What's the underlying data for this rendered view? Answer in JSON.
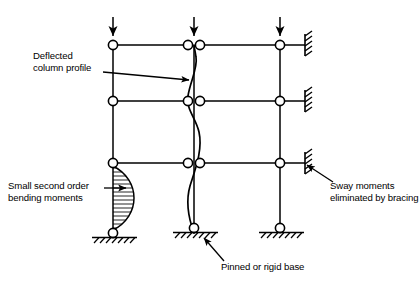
{
  "figure": {
    "type": "structural-engineering-diagram",
    "background_color": "#ffffff",
    "line_color": "#000000",
    "width": 419,
    "height": 285
  },
  "labels": {
    "deflected_profile": "Deflected\ncolumn profile",
    "small_moments": "Small second order\nbending moments",
    "sway": "Sway moments\neliminated by bracing",
    "base": "Pinned or rigid base"
  },
  "frame": {
    "columns": [
      {
        "name": "left-column",
        "x": 113,
        "top_y": 45,
        "base_y": 233
      },
      {
        "name": "middle-column",
        "x": 194,
        "top_y": 45,
        "base_y": 228
      },
      {
        "name": "right-column",
        "x": 280,
        "top_y": 45,
        "base_y": 228
      }
    ],
    "beam_levels": [
      {
        "name": "roof-beam-level",
        "y": 45
      },
      {
        "name": "second-floor-beam-level",
        "y": 101
      },
      {
        "name": "first-floor-beam-level",
        "y": 163
      }
    ],
    "beam_right_end_x": 305,
    "joint_radius": 4.6
  },
  "loads": [
    {
      "name": "load-arrow-left",
      "x": 113,
      "symbol": "down-arrow"
    },
    {
      "name": "load-arrow-middle",
      "x": 194,
      "symbol": "down-arrow"
    },
    {
      "name": "load-arrow-right",
      "x": 280,
      "symbol": "down-arrow"
    }
  ],
  "bracing_supports": [
    {
      "name": "bracing-support-level-1",
      "x": 306,
      "y": 45
    },
    {
      "name": "bracing-support-level-2",
      "x": 306,
      "y": 101
    },
    {
      "name": "bracing-support-level-3",
      "x": 306,
      "y": 163
    }
  ],
  "bases": [
    {
      "name": "base-left",
      "x": 113,
      "y": 233
    },
    {
      "name": "base-middle",
      "x": 194,
      "y": 228
    },
    {
      "name": "base-right",
      "x": 280,
      "y": 228
    }
  ],
  "annotations": {
    "bending_moment_diagram": {
      "name": "bending-moment-diagram",
      "column": "left-column",
      "from_y": 166,
      "to_y": 230,
      "max_offset": 28,
      "hatch": "horizontal"
    },
    "deflection_curve": {
      "name": "deflected-column-profile-curve",
      "column": "middle-column",
      "shape": "s-curve",
      "amplitude": 7
    }
  },
  "leaders": [
    {
      "name": "leader-deflected-profile",
      "from": [
        113,
        72
      ],
      "to": [
        193,
        79
      ]
    },
    {
      "name": "leader-small-moments",
      "from": [
        106,
        189
      ],
      "to": [
        128,
        189
      ]
    },
    {
      "name": "leader-sway",
      "from": [
        330,
        182
      ],
      "to": [
        305,
        165
      ]
    },
    {
      "name": "leader-base",
      "from": [
        222,
        262
      ],
      "to": [
        203,
        237
      ]
    }
  ]
}
